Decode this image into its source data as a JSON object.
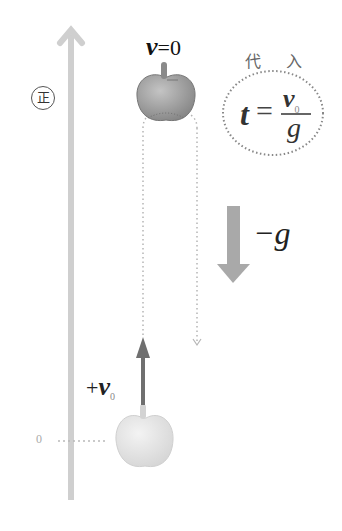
{
  "diagram": {
    "axis": {
      "direction_label": "正",
      "origin_label": "0",
      "color": "#cccccc"
    },
    "top_state": {
      "velocity_symbol": "v",
      "velocity_value": "=0"
    },
    "bottom_state": {
      "velocity_label_prefix": "+",
      "velocity_symbol": "v",
      "velocity_subscript": "0"
    },
    "acceleration": {
      "label": "−g",
      "arrow_color": "#a9a9a9"
    },
    "substitution_note": {
      "label": "代 入",
      "formula_lhs": "t",
      "formula_eq": "=",
      "numerator_symbol": "v",
      "numerator_subscript": "0",
      "denominator": "g"
    },
    "colors": {
      "top_apple": "#9a9a9a",
      "bottom_apple": "#e3e3e3",
      "initial_velocity_arrow": "#6f6f6f",
      "dotted_path": "#b5b5b5"
    }
  }
}
